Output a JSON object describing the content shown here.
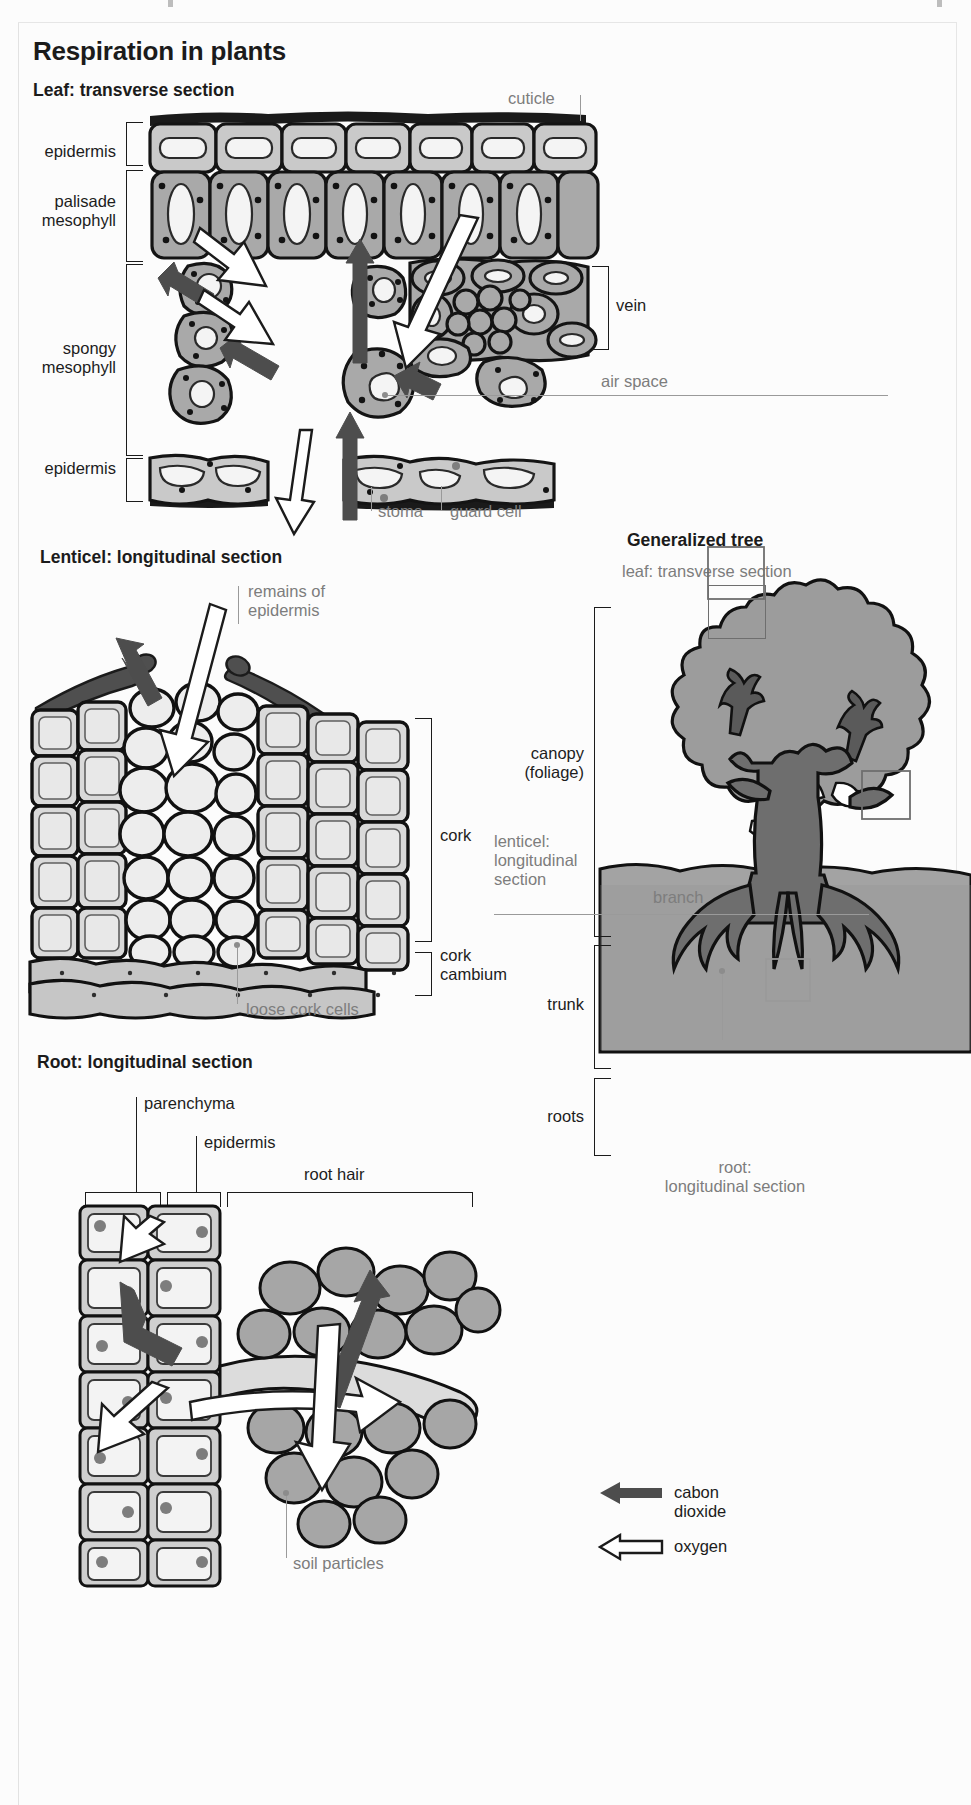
{
  "page": {
    "title": "Respiration in plants"
  },
  "colors": {
    "ink": "#1b1b1b",
    "label_gray": "#7d7d7d",
    "cell_fill": "#a9a9a9",
    "cell_light": "#d6d6d6",
    "vacuole": "#f2f2f2",
    "co2_arrow": "#4d4d4d",
    "o2_arrow": "#ffffff",
    "tree_canopy": "#9c9c9c",
    "tree_trunk": "#6e6e6e",
    "soil": "#a9a9a9",
    "background": "#fcfcfc"
  },
  "sections": {
    "leaf": {
      "heading": "Leaf: transverse section",
      "labels": {
        "epidermis_top": "epidermis",
        "palisade_mesophyll": "palisade\nmesophyll",
        "palisade_line1": "palisade",
        "palisade_line2": "mesophyll",
        "spongy_line1": "spongy",
        "spongy_line2": "mesophyll",
        "epidermis_bottom": "epidermis",
        "cuticle": "cuticle",
        "vein": "vein",
        "air_space": "air space",
        "stoma": "stoma",
        "guard_cell": "guard cell"
      }
    },
    "lenticel": {
      "heading": "Lenticel: longitudinal section",
      "labels": {
        "remains_line1": "remains of",
        "remains_line2": "epidermis",
        "cork": "cork",
        "cork_cambium_line1": "cork",
        "cork_cambium_line2": "cambium",
        "loose_cork_cells": "loose cork cells"
      }
    },
    "tree": {
      "heading": "Generalized tree",
      "labels": {
        "leaf_transverse_section": "leaf: transverse section",
        "canopy_line1": "canopy",
        "canopy_line2": "(foliage)",
        "lenticel_line1": "lenticel:",
        "lenticel_line2": "longitudinal",
        "lenticel_line3": "section",
        "trunk": "trunk",
        "branch": "branch",
        "roots": "roots",
        "root_line1": "root:",
        "root_line2": "longitudinal section"
      }
    },
    "root": {
      "heading": "Root: longitudinal section",
      "labels": {
        "parenchyma": "parenchyma",
        "epidermis": "epidermis",
        "root_hair": "root hair",
        "soil_particles": "soil particles"
      }
    }
  },
  "legend": {
    "items": [
      {
        "id": "carbon-dioxide",
        "label": "cabon dioxide",
        "style": "solid-dark-arrow"
      },
      {
        "id": "oxygen",
        "label": "oxygen",
        "style": "white-outline-arrow"
      }
    ]
  }
}
